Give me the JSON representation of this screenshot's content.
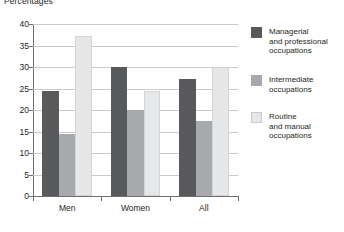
{
  "chart_data": {
    "type": "bar",
    "title": "Percentages",
    "xlabel": "",
    "ylabel": "",
    "ylim": [
      0,
      40
    ],
    "yticks": [
      0,
      5,
      10,
      15,
      20,
      25,
      30,
      35,
      40
    ],
    "ytick_labels": [
      "0",
      "5",
      "10",
      "15",
      "20",
      "25",
      "30",
      "35",
      "40"
    ],
    "grid": true,
    "legend_position": "right",
    "categories": [
      "Men",
      "Women",
      "All"
    ],
    "series": [
      {
        "name": "Managerial\nand professional\noccupations",
        "color": "#58595b",
        "values": [
          24.4,
          30.0,
          27.3
        ]
      },
      {
        "name": "Intermediate\noccupations",
        "color": "#a7a9ac",
        "values": [
          14.5,
          20.0,
          17.5
        ]
      },
      {
        "name": "Routine\nand manual\noccupations",
        "color": "#e6e7e8",
        "values": [
          37.3,
          24.5,
          30.0
        ]
      }
    ]
  },
  "legend": {
    "items": [
      {
        "label": "Managerial\nand professional\noccupations",
        "color": "#58595b"
      },
      {
        "label": "Intermediate\noccupations",
        "color": "#a7a9ac"
      },
      {
        "label": "Routine\nand manual\noccupations",
        "color": "#e6e7e8"
      }
    ]
  },
  "axis": {
    "y_tick_labels": [
      "40",
      "35",
      "30",
      "25",
      "20",
      "15",
      "10",
      "5",
      "0"
    ],
    "x_tick_labels": [
      "Men",
      "Women",
      "All"
    ]
  }
}
